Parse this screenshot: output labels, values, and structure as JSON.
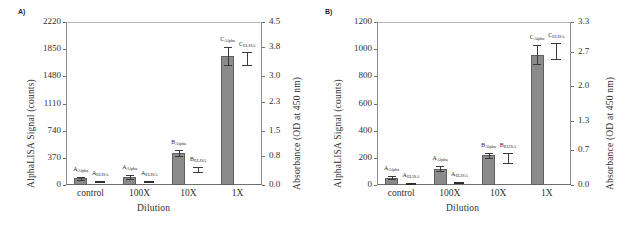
{
  "figure": {
    "panels": [
      {
        "panel_label": "A)",
        "left_axis_title": "AlphaLISA Signal (counts)",
        "right_axis_title": "Absorbance (OD at 450 nm)",
        "x_axis_title": "Dilution",
        "left_ticks": [
          "0",
          "370",
          "740",
          "1110",
          "1480",
          "1850",
          "2220"
        ],
        "right_ticks": [
          "0.0",
          "0.8",
          "1.5",
          "2.3",
          "3.0",
          "3.8",
          "4.5"
        ],
        "categories": [
          "control",
          "100X",
          "10X",
          "1X"
        ],
        "series_labels": [
          {
            "base": "A",
            "sub": "Alpha"
          },
          {
            "base": "A",
            "sub": "ELISA"
          },
          {
            "base": "A",
            "sub": "Alpha"
          },
          {
            "base": "A",
            "sub": "ELISA"
          },
          {
            "base": "B",
            "sub": "Alpha"
          },
          {
            "base": "B",
            "sub": "ELISA"
          },
          {
            "base": "C",
            "sub": "Alpha"
          },
          {
            "base": "C",
            "sub": "ELISA"
          }
        ]
      },
      {
        "panel_label": "B)",
        "left_axis_title": "AlphaLISA Signal (counts)",
        "right_axis_title": "Absorbance (OD at 450 nm)",
        "x_axis_title": "Dilution",
        "left_ticks": [
          "0",
          "200",
          "400",
          "600",
          "800",
          "1000",
          "1200"
        ],
        "right_ticks": [
          "0.0",
          "0.7",
          "1.3",
          "2.0",
          "2.7",
          "3.3"
        ],
        "categories": [
          "control",
          "100X",
          "10X",
          "1X"
        ],
        "series_labels": [
          {
            "base": "A",
            "sub": "Alpha"
          },
          {
            "base": "A",
            "sub": "ELISA"
          },
          {
            "base": "A",
            "sub": "Alpha"
          },
          {
            "base": "A",
            "sub": "ELISA"
          },
          {
            "base": "B",
            "sub": "Alpha"
          },
          {
            "base": "B",
            "sub": "ELISA"
          },
          {
            "base": "C",
            "sub": "Alpha"
          },
          {
            "base": "C",
            "sub": "ELISA"
          }
        ]
      }
    ]
  },
  "chart_data": [
    {
      "type": "bar",
      "title": "A)",
      "xlabel": "Dilution",
      "ylabel": "AlphaLISA Signal (counts)",
      "y2label": "Absorbance (OD at 450 nm)",
      "categories": [
        "control",
        "100X",
        "10X",
        "1X"
      ],
      "ylim": [
        0,
        2220
      ],
      "y2lim": [
        0.0,
        4.5
      ],
      "yticks": [
        0,
        370,
        740,
        1110,
        1480,
        1850,
        2220
      ],
      "y2ticks": [
        0.0,
        0.8,
        1.5,
        2.3,
        3.0,
        3.8,
        4.5
      ],
      "grid": false,
      "legend": "none",
      "series": [
        {
          "name": "AlphaLISA",
          "axis": "left",
          "point_labels": [
            "A_Alpha",
            "A_Alpha",
            "B_Alpha",
            "C_Alpha"
          ],
          "values": [
            90,
            110,
            440,
            1760
          ],
          "errors": [
            25,
            25,
            40,
            120
          ]
        },
        {
          "name": "ELISA",
          "axis": "right",
          "point_labels": [
            "A_ELISA",
            "A_ELISA",
            "B_ELISA",
            "C_ELISA"
          ],
          "values": [
            0.1,
            0.12,
            0.42,
            3.5
          ],
          "errors": [
            0.03,
            0.03,
            0.07,
            0.18
          ]
        }
      ]
    },
    {
      "type": "bar",
      "title": "B)",
      "xlabel": "Dilution",
      "ylabel": "AlphaLISA Signal (counts)",
      "y2label": "Absorbance (OD at 450 nm)",
      "categories": [
        "control",
        "100X",
        "10X",
        "1X"
      ],
      "ylim": [
        0,
        1200
      ],
      "y2lim": [
        0.0,
        3.3
      ],
      "yticks": [
        0,
        200,
        400,
        600,
        800,
        1000,
        1200
      ],
      "y2ticks": [
        0.0,
        0.7,
        1.3,
        2.0,
        2.7,
        3.3
      ],
      "grid": false,
      "legend": "none",
      "series": [
        {
          "name": "AlphaLISA",
          "axis": "left",
          "point_labels": [
            "A_Alpha",
            "A_Alpha",
            "B_Alpha",
            "C_Alpha"
          ],
          "values": [
            55,
            120,
            220,
            960
          ],
          "errors": [
            12,
            18,
            18,
            70
          ]
        },
        {
          "name": "ELISA",
          "axis": "right",
          "point_labels": [
            "A_ELISA",
            "A_ELISA",
            "B_ELISA",
            "C_ELISA"
          ],
          "values": [
            0.05,
            0.06,
            0.55,
            2.72
          ],
          "errors": [
            0.02,
            0.02,
            0.1,
            0.16
          ]
        }
      ]
    }
  ]
}
